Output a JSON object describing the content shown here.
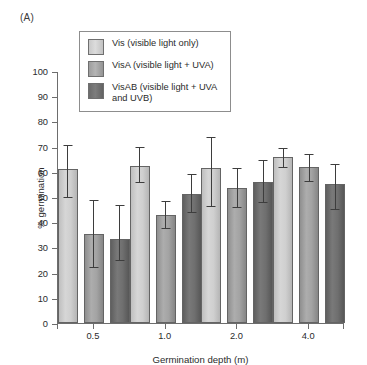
{
  "panel": {
    "label": "(A)"
  },
  "legend": {
    "items": [
      {
        "key": "Vis",
        "label": "Vis (visible light only)",
        "color": "#cfcfcf"
      },
      {
        "key": "VisA",
        "label": "VisA (visible light + UVA)",
        "color": "#a3a3a3"
      },
      {
        "key": "VisAB",
        "label": "VisAB (visible light + UVA and UVB)",
        "color": "#6f6f6f"
      }
    ]
  },
  "chart_data": {
    "type": "bar",
    "title": "",
    "xlabel": "Germination depth (m)",
    "ylabel": "% germination",
    "categories": [
      "0.5",
      "1.0",
      "2.0",
      "4.0"
    ],
    "ylim": [
      0,
      100
    ],
    "yticks": [
      0,
      10,
      20,
      30,
      40,
      50,
      60,
      70,
      80,
      90,
      100
    ],
    "ytick_labels": [
      "0",
      "10",
      "20",
      "30",
      "40",
      "50",
      "60",
      "70",
      "80",
      "90",
      "100"
    ],
    "grid": false,
    "legend_position": "top-left-inset",
    "error_bar_type": "asymmetric-range",
    "series": [
      {
        "name": "Vis (visible light only)",
        "color": "#cfcfcf",
        "values": [
          61,
          62.5,
          61.5,
          66
        ],
        "err_low": [
          49.5,
          55.5,
          46,
          61.5
        ],
        "err_high": [
          70.5,
          70,
          74,
          69.5
        ]
      },
      {
        "name": "VisA (visible light + UVA)",
        "color": "#a3a3a3",
        "values": [
          35.5,
          43,
          53.5,
          62
        ],
        "err_low": [
          22,
          37.5,
          45.5,
          56
        ],
        "err_high": [
          49,
          48.5,
          61.5,
          67
        ]
      },
      {
        "name": "VisAB (visible light + UVA and UVB)",
        "color": "#6f6f6f",
        "values": [
          33.5,
          51,
          56,
          55
        ],
        "err_low": [
          24.5,
          43.5,
          47.5,
          45
        ],
        "err_high": [
          47,
          59,
          64.5,
          63
        ]
      }
    ]
  }
}
